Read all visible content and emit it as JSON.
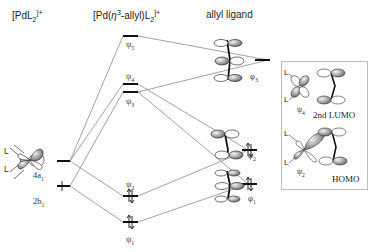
{
  "headers": {
    "pdl2": "[PdL",
    "pdl2_sub": "2",
    "pdl2_sup": "]+",
    "complex": "[Pd(",
    "complex_eta": "η",
    "complex_eta_sup": "3",
    "complex_rest": "-allyl)L",
    "complex_sub": "2",
    "complex_sup": "]+",
    "allyl": "allyl ligand"
  },
  "pdl2_orbitals": [
    {
      "label": "4a",
      "sub": "1",
      "occupancy": "empty"
    },
    {
      "label": "2b",
      "sub": "1",
      "occupancy": "filled"
    }
  ],
  "complex_orbitals": [
    {
      "label": "ψ",
      "sub": "5",
      "occupancy": "empty"
    },
    {
      "label": "ψ",
      "sub": "4",
      "occupancy": "empty"
    },
    {
      "label": "ψ",
      "sub": "3",
      "occupancy": "empty"
    },
    {
      "label": "ψ",
      "sub": "2",
      "occupancy": "filled"
    },
    {
      "label": "ψ",
      "sub": "1",
      "occupancy": "filled"
    }
  ],
  "allyl_orbitals": [
    {
      "label": "φ",
      "sub": "3",
      "occupancy": "empty"
    },
    {
      "label": "φ",
      "sub": "2",
      "occupancy": "filled"
    },
    {
      "label": "φ",
      "sub": "1",
      "occupancy": "filled"
    }
  ],
  "panel": {
    "top": {
      "label": "ψ",
      "sub": "4",
      "name": "2nd LUMO",
      "ligand": "L"
    },
    "bottom": {
      "label": "ψ",
      "sub": "2",
      "name": "HOMO",
      "ligand": "L"
    }
  },
  "colors": {
    "line": "#8a8a8a",
    "level": "#111111",
    "panel_border": "#bdbdbd"
  }
}
